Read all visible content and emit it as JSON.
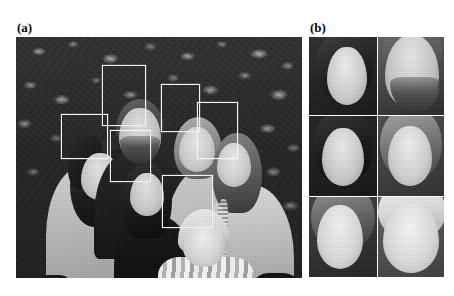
{
  "figure": {
    "background_color": "#ffffff",
    "width": 454,
    "height": 296,
    "caption_style": "bold-serif-parenthetical"
  },
  "panels": [
    {
      "id": "a",
      "label": "(a)",
      "label_position": {
        "x": 17,
        "y": 21
      },
      "type": "photograph-with-detections",
      "description": "Grayscale group photograph of six people in front of a leafy hedge, overlaid with white face-detection bounding boxes",
      "bounds": {
        "x": 16,
        "y": 37,
        "width": 286,
        "height": 241
      },
      "detection_box_color": "#f2f2f2",
      "detection_count": 6,
      "detections": [
        {
          "name": "man-back-center",
          "x": 102,
          "y": 65,
          "width": 44,
          "height": 61
        },
        {
          "name": "woman-back-right",
          "x": 161,
          "y": 84,
          "width": 39,
          "height": 48
        },
        {
          "name": "woman-left",
          "x": 61,
          "y": 114,
          "width": 47,
          "height": 45
        },
        {
          "name": "girl-center",
          "x": 110,
          "y": 130,
          "width": 41,
          "height": 52
        },
        {
          "name": "girl-right",
          "x": 197,
          "y": 102,
          "width": 41,
          "height": 57
        },
        {
          "name": "child-front-center",
          "x": 162,
          "y": 175,
          "width": 51,
          "height": 53
        }
      ]
    },
    {
      "id": "b",
      "label": "(b)",
      "label_position": {
        "x": 310,
        "y": 21
      },
      "type": "crop-grid",
      "description": "Grid of the six cropped and normalized face regions extracted from panel (a)",
      "bounds": {
        "x": 309,
        "y": 37,
        "width": 136,
        "height": 241
      },
      "grid": {
        "columns": 2,
        "rows": 3,
        "cell_count": 6
      },
      "crops": [
        {
          "index": 1,
          "name": "crop-woman-left",
          "row": 1,
          "column": 1
        },
        {
          "index": 2,
          "name": "crop-man-back-center",
          "row": 1,
          "column": 2
        },
        {
          "index": 3,
          "name": "crop-girl-center",
          "row": 2,
          "column": 1
        },
        {
          "index": 4,
          "name": "crop-woman-back-right",
          "row": 2,
          "column": 2
        },
        {
          "index": 5,
          "name": "crop-girl-right",
          "row": 3,
          "column": 1
        },
        {
          "index": 6,
          "name": "crop-child",
          "row": 3,
          "column": 2
        }
      ]
    }
  ]
}
